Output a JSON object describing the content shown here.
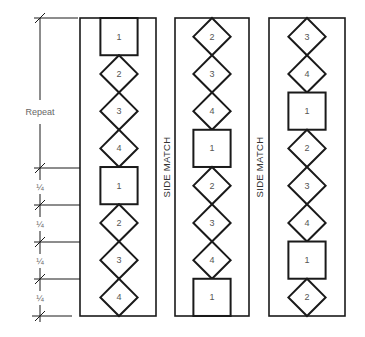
{
  "diagram": {
    "colors": {
      "line": "#1a1a1a",
      "text": "#555555",
      "background": "#ffffff"
    },
    "dimension": {
      "repeat_label": "Repeat",
      "quarter_label": "¼",
      "quarter_count": 4
    },
    "side_match_label": "SIDE MATCH",
    "strips": [
      {
        "name": "strip-1",
        "sequence": [
          "1",
          "2",
          "3",
          "4",
          "1",
          "2",
          "3",
          "4"
        ]
      },
      {
        "name": "strip-2",
        "sequence": [
          "2",
          "3",
          "4",
          "1",
          "2",
          "3",
          "4",
          "1"
        ]
      },
      {
        "name": "strip-3",
        "sequence": [
          "3",
          "4",
          "1",
          "2",
          "3",
          "4",
          "1",
          "2"
        ]
      }
    ],
    "legend": {
      "square": "1",
      "diamond": [
        "2",
        "3",
        "4"
      ]
    }
  }
}
